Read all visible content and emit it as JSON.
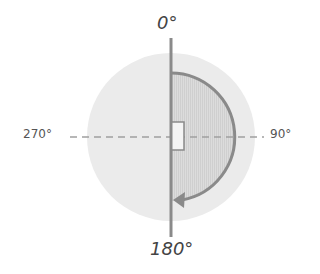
{
  "diagram": {
    "labels": {
      "top": "0°",
      "bottom": "180°",
      "left": "270°",
      "right": "90°"
    },
    "colors": {
      "outer_circle": "#ebebeb",
      "half_disc_fill": "#d8d8d8",
      "axis_line": "#8a8a8a",
      "dashed_line": "#a0a0a0",
      "arc": "#8a8a8a"
    },
    "shapes": {
      "outer_circle": {
        "cx": 171,
        "cy": 137,
        "r": 84
      },
      "half_disc": {
        "cx": 171,
        "cy": 137,
        "r": 64,
        "side": "right"
      },
      "arc_arrow": {
        "from_deg": 0,
        "to_deg": 180,
        "direction": "clockwise"
      },
      "center_marker": "small rectangle"
    }
  }
}
